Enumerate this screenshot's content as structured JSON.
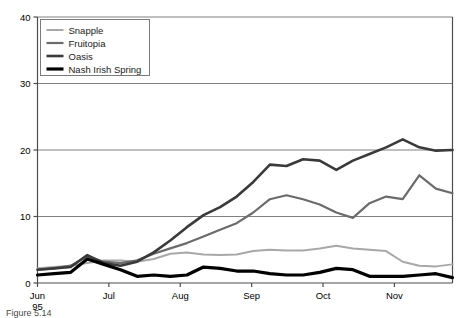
{
  "chart_data": {
    "type": "line",
    "title": "",
    "xlabel": "",
    "ylabel": "",
    "ylim": [
      0,
      40
    ],
    "yticks": [
      0,
      10,
      20,
      30,
      40
    ],
    "ytick_labels": [
      "0",
      "10",
      "20",
      "30",
      "40"
    ],
    "grid": "horizontal",
    "legend_position": "top-left",
    "xtick_labels": [
      "Jun",
      "Jul",
      "Aug",
      "Sep",
      "Oct",
      "Nov"
    ],
    "xtick_sublabel": "95",
    "xtick_positions": [
      0,
      4.3,
      8.6,
      12.9,
      17.2,
      21.5
    ],
    "x": [
      0,
      1,
      2,
      3,
      4,
      5,
      6,
      7,
      8,
      9,
      10,
      11,
      12,
      13,
      14,
      15,
      16,
      17,
      18,
      19,
      20,
      21,
      22,
      23,
      24,
      25
    ],
    "series": [
      {
        "name": "Snapple",
        "color": "#a8a8a8",
        "width": 2.0,
        "values": [
          2.2,
          2.4,
          2.6,
          3.0,
          3.4,
          3.4,
          3.2,
          3.6,
          4.4,
          4.6,
          4.3,
          4.2,
          4.3,
          4.8,
          5.0,
          4.9,
          4.9,
          5.2,
          5.6,
          5.2,
          5.0,
          4.8,
          3.2,
          2.6,
          2.5,
          2.8
        ]
      },
      {
        "name": "Fruitopia",
        "color": "#6b6b6b",
        "width": 2.2,
        "values": [
          2.0,
          2.2,
          2.6,
          4.0,
          3.2,
          3.0,
          3.4,
          4.4,
          5.2,
          6.0,
          7.0,
          8.0,
          9.0,
          10.6,
          12.6,
          13.2,
          12.6,
          11.8,
          10.6,
          9.8,
          12.0,
          13.0,
          12.6,
          16.2,
          14.2,
          13.5
        ]
      },
      {
        "name": "Oasis",
        "color": "#3a3a3a",
        "width": 2.6,
        "values": [
          2.0,
          2.2,
          2.4,
          4.2,
          3.0,
          2.6,
          3.2,
          4.6,
          6.4,
          8.4,
          10.2,
          11.4,
          13.0,
          15.2,
          17.8,
          17.6,
          18.6,
          18.4,
          17.0,
          18.4,
          19.4,
          20.4,
          21.6,
          20.4,
          19.9,
          20.0
        ]
      },
      {
        "name": "Nash Irish Spring",
        "color": "#000000",
        "width": 3.2,
        "values": [
          1.2,
          1.4,
          1.6,
          3.6,
          2.8,
          2.0,
          1.0,
          1.2,
          1.0,
          1.2,
          2.4,
          2.2,
          1.8,
          1.8,
          1.4,
          1.2,
          1.2,
          1.6,
          2.2,
          2.0,
          1.0,
          1.0,
          1.0,
          1.2,
          1.4,
          0.8
        ]
      }
    ]
  },
  "legend": {
    "entries": [
      {
        "label": "Snapple"
      },
      {
        "label": "Fruitopia"
      },
      {
        "label": "Oasis"
      },
      {
        "label": "Nash Irish Spring"
      }
    ]
  },
  "caption": {
    "text": "Figure 5.14"
  },
  "colors": {
    "axis": "#4d4d4d",
    "gridline": "#808080",
    "legend_border": "#7a7a7a",
    "background": "#ffffff"
  }
}
